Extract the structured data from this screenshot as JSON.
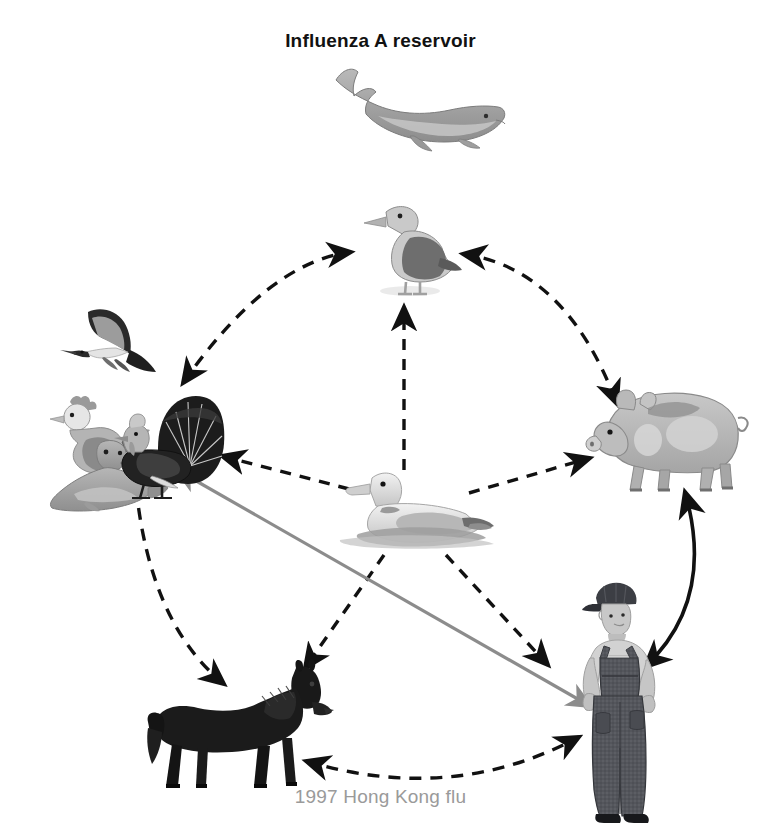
{
  "figure": {
    "title": "Influenza A reservoir",
    "caption": "1997 Hong Kong flu",
    "type": "transmission-cycle-diagram",
    "title_color": "#111111",
    "caption_color": "#9a9a9a",
    "background": "#ffffff"
  },
  "nodes": [
    {
      "id": "whale",
      "label": "whale",
      "group": "marine-mammal",
      "x": 410,
      "y": 108,
      "note": "influenza A reservoir host, top of figure"
    },
    {
      "id": "gull",
      "label": "gull",
      "group": "wild-shorebird",
      "x": 404,
      "y": 250,
      "note": "shorebird at top of transmission circle"
    },
    {
      "id": "wild-birds",
      "label": "wild birds",
      "group": "wild-bird",
      "x": 110,
      "y": 350,
      "note": "flying seabird, upper left of poultry cluster"
    },
    {
      "id": "chicken",
      "label": "chicken",
      "group": "domestic-poultry",
      "x": 95,
      "y": 420,
      "note": "domestic hen"
    },
    {
      "id": "turkey",
      "label": "turkey",
      "group": "domestic-poultry",
      "x": 165,
      "y": 435,
      "note": "turkey displaying fanned tail"
    },
    {
      "id": "seal",
      "label": "seal",
      "group": "marine-mammal",
      "x": 90,
      "y": 470,
      "note": "seal at lower left of cluster"
    },
    {
      "id": "pig",
      "label": "pig",
      "group": "swine",
      "x": 665,
      "y": 425,
      "note": "mixing vessel host, right side"
    },
    {
      "id": "duck",
      "label": "duck",
      "group": "waterfowl",
      "x": 415,
      "y": 510,
      "note": "central waterfowl reservoir, on water"
    },
    {
      "id": "horse",
      "label": "horse",
      "group": "equine",
      "x": 238,
      "y": 725,
      "note": "equine host, bottom left"
    },
    {
      "id": "human",
      "label": "human",
      "group": "human",
      "x": 622,
      "y": 700,
      "note": "farmer in cap and overalls, bottom right"
    }
  ],
  "links": [
    {
      "from": "wild-birds",
      "to": "gull",
      "style": "dashed",
      "color": "#111111",
      "heads": "both",
      "shape": "arc",
      "name": "wild-birds-gull-link"
    },
    {
      "from": "gull",
      "to": "pig",
      "style": "dashed",
      "color": "#111111",
      "heads": "both",
      "shape": "arc",
      "name": "gull-pig-link"
    },
    {
      "from": "turkey",
      "to": "horse",
      "style": "dashed",
      "color": "#111111",
      "heads": "one",
      "shape": "arc",
      "name": "poultry-horse-link"
    },
    {
      "from": "horse",
      "to": "human",
      "style": "dashed",
      "color": "#111111",
      "heads": "both",
      "shape": "arc",
      "name": "horse-human-link"
    },
    {
      "from": "duck",
      "to": "gull",
      "style": "dashed",
      "color": "#111111",
      "heads": "one",
      "shape": "line",
      "name": "duck-gull-link"
    },
    {
      "from": "duck",
      "to": "turkey",
      "style": "dashed",
      "color": "#111111",
      "heads": "one",
      "shape": "line",
      "name": "duck-poultry-link"
    },
    {
      "from": "duck",
      "to": "pig",
      "style": "dashed",
      "color": "#111111",
      "heads": "one",
      "shape": "line",
      "name": "duck-pig-link"
    },
    {
      "from": "duck",
      "to": "horse",
      "style": "dashed",
      "color": "#111111",
      "heads": "one",
      "shape": "line",
      "name": "duck-horse-link"
    },
    {
      "from": "duck",
      "to": "human",
      "style": "dashed",
      "color": "#111111",
      "heads": "one",
      "shape": "line",
      "name": "duck-human-link"
    },
    {
      "from": "turkey",
      "to": "human",
      "style": "solid",
      "color": "#8c8c8c",
      "heads": "both",
      "shape": "line",
      "name": "poultry-human-link"
    },
    {
      "from": "pig",
      "to": "human",
      "style": "solid",
      "color": "#111111",
      "heads": "both",
      "shape": "arc",
      "name": "pig-human-link"
    }
  ],
  "legend_notes": {
    "dashed_black": "wild and domestic animal transmission routes",
    "solid_gray": "direct poultry to human transmission",
    "solid_black": "pig to human transmission"
  }
}
